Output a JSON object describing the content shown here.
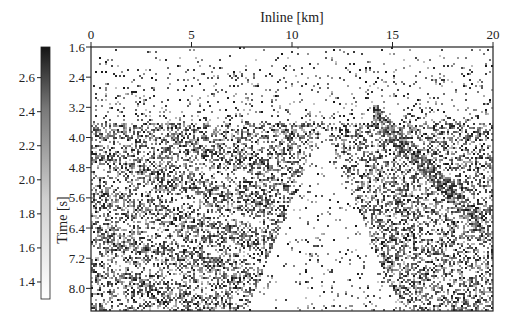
{
  "chart_data": {
    "type": "heatmap",
    "title": "",
    "subtitle": "seismic inline section (grayscale image)",
    "xlabel": "Inline [km]",
    "ylabel": "Time [s]",
    "xlim": [
      0,
      20
    ],
    "ylim": [
      1.6,
      8.6
    ],
    "y_inverted": true,
    "xticks": [
      0,
      5,
      10,
      15,
      20
    ],
    "xtick_labels": [
      "0",
      "5",
      "10",
      "15",
      "20"
    ],
    "xaxis_position": "top",
    "yticks": [
      1.6,
      2.4,
      3.2,
      4.0,
      4.8,
      5.6,
      6.4,
      7.2,
      8.0
    ],
    "ytick_labels": [
      "1.6",
      "2.4",
      "3.2",
      "4.0",
      "4.8",
      "5.6",
      "6.4",
      "7.2",
      "8.0"
    ],
    "grid": false,
    "colormap": "gray_r",
    "colorbar": {
      "position": "left",
      "range": [
        1.3,
        2.78
      ],
      "ticks": [
        1.4,
        1.6,
        1.8,
        2.0,
        2.2,
        2.4,
        2.6
      ],
      "tick_labels": [
        "1.4",
        "1.6",
        "1.8",
        "2.0",
        "2.2",
        "2.4",
        "2.6"
      ],
      "color_low": "#ffffff",
      "color_high": "#1a1a1a"
    },
    "features": [
      {
        "description": "faint noisy zone near top",
        "time_range": [
          1.6,
          3.2
        ]
      },
      {
        "description": "dark dipping reflectors on left flank",
        "inline_range": [
          0,
          9
        ],
        "time_range": [
          3.6,
          8.4
        ]
      },
      {
        "description": "bright (white) central wedge",
        "inline_range": [
          8,
          15
        ],
        "time_range": [
          4.0,
          8.6
        ]
      },
      {
        "description": "dark dipping fault-like streak on right",
        "inline_range": [
          14,
          19
        ],
        "time_range": [
          3.6,
          5.6
        ]
      }
    ]
  }
}
